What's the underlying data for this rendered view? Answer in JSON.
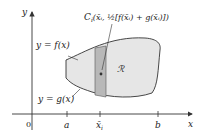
{
  "diagram": {
    "axes": {
      "x_label": "x",
      "y_label": "y",
      "origin_label": "0"
    },
    "ticks": [
      {
        "label": "a"
      },
      {
        "label": "x̄",
        "subscript": "i"
      },
      {
        "label": "b"
      }
    ],
    "curves": {
      "upper_label": "y = f(x)",
      "lower_label": "y = g(x)"
    },
    "region_label": "ℛ",
    "centroid_label": {
      "name": "C",
      "sub": "i",
      "coords": "(x̄ᵢ, ½[f(x̄ᵢ) + g(x̄ᵢ)])"
    },
    "colors": {
      "region_fill": "#e6e6e6",
      "strip_fill": "#b8b8b8",
      "stroke": "#333333"
    }
  }
}
